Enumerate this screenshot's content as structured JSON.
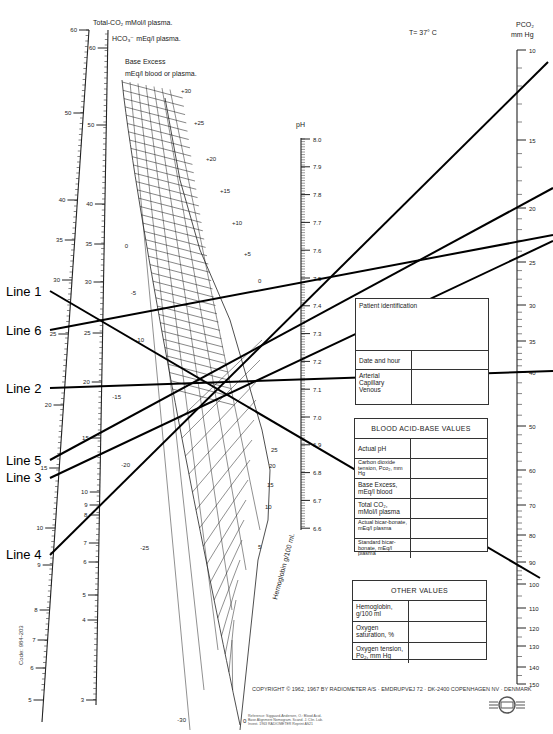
{
  "temperature": "T= 37° C",
  "scales": {
    "total_co2": {
      "title": "Total-CO₂ mMol/l plasma.",
      "ticks": [
        "60",
        "50",
        "40",
        "35",
        "30",
        "25",
        "20",
        "15",
        "10",
        "9",
        "8",
        "7",
        "6",
        "5"
      ]
    },
    "hco3": {
      "title": "HCO₃⁻ mEq/l plasma.",
      "ticks": [
        "60",
        "50",
        "40",
        "35",
        "30",
        "25",
        "20",
        "15",
        "10",
        "9",
        "8",
        "7",
        "6",
        "5",
        "4",
        "3"
      ]
    },
    "base_excess": {
      "title_line1": "Base Excess",
      "title_line2": "mEq/l blood or plasma.",
      "ticks_right": [
        "+30",
        "+25",
        "+20",
        "+15",
        "+10",
        "+5",
        "0"
      ],
      "ticks_left": [
        "0",
        "-5",
        "-10",
        "-15",
        "-20",
        "-25",
        "-30"
      ]
    },
    "ph": {
      "title": "pH",
      "ticks": [
        "8.0",
        "7.9",
        "7.8",
        "7.7",
        "7.6",
        "7.5",
        "7.4",
        "7.3",
        "7.2",
        "7.1",
        "7.0",
        "6.9",
        "6.8",
        "6.7",
        "6.6"
      ]
    },
    "pco2": {
      "title_line1": "PCO₂",
      "title_line2": "mm Hg",
      "ticks": [
        "10",
        "15",
        "20",
        "25",
        "30",
        "35",
        "40",
        "50",
        "60",
        "70",
        "80",
        "90",
        "100",
        "110",
        "120",
        "130",
        "140",
        "150"
      ]
    },
    "hemoglobin": {
      "title": "Hemoglobin g/100 ml.",
      "ticks": [
        "25",
        "20",
        "15",
        "10",
        "5",
        "0"
      ]
    }
  },
  "lines": [
    {
      "label": "Line 1",
      "x1": 50,
      "y1": 291,
      "x2": 540,
      "y2": 578
    },
    {
      "label": "Line 6",
      "x1": 50,
      "y1": 330,
      "x2": 553,
      "y2": 235
    },
    {
      "label": "Line 2",
      "x1": 50,
      "y1": 388,
      "x2": 553,
      "y2": 371
    },
    {
      "label": "Line 5",
      "x1": 50,
      "y1": 460,
      "x2": 553,
      "y2": 188
    },
    {
      "label": "Line 3",
      "x1": 50,
      "y1": 478,
      "x2": 553,
      "y2": 241
    },
    {
      "label": "Line 4",
      "x1": 50,
      "y1": 555,
      "x2": 548,
      "y2": 62
    }
  ],
  "patient_box": {
    "title": "Patient identification",
    "rows": [
      "Date and hour",
      "Arterial\nCapillary\nVenous"
    ]
  },
  "blood_values": {
    "title": "BLOOD ACID-BASE VALUES",
    "rows": [
      "Actual pH",
      "Carbon dioxide tension, Pco₂, mm Hg",
      "Base Excess, mEq/l blood",
      "Total CO₂, mMol/l plasma",
      "Actual bicar-bonate, mEq/l plasma",
      "Standard bicar-bonate, mEq/l plasma"
    ]
  },
  "other_values": {
    "title": "OTHER VALUES",
    "rows": [
      "Hemoglobin, g/100 ml",
      "Oxygen saturation, %",
      "Oxygen tension, Po₂, mm Hg"
    ]
  },
  "copyright": "COPYRIGHT © 1962, 1967 BY RADIOMETER A/S · EMDRUPVEJ 72 · DK-2400 COPENHAGEN NV · DENMARK",
  "reference": "Reference: Siggaard-Andersen, O.: Blood Acid-Base Alignment Nomogram. Scand. J. Clin. Lab. Invest. 1963 RADIOMETER Reprint AS21",
  "code": "Code: 984-203"
}
